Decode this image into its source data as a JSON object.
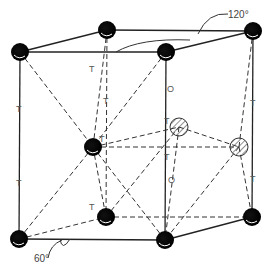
{
  "figure": {
    "type": "crystal-structure-hcp-unit-cell",
    "angles": {
      "top": "120°",
      "bottom": "60°"
    },
    "site_labels": {
      "tetrahedral": "T",
      "octahedral": "O"
    },
    "atoms": {
      "solid": [
        {
          "x": 107,
          "y": 30
        },
        {
          "x": 253,
          "y": 31
        },
        {
          "x": 20,
          "y": 52
        },
        {
          "x": 166,
          "y": 52
        },
        {
          "x": 93,
          "y": 147
        },
        {
          "x": 106,
          "y": 217
        },
        {
          "x": 252,
          "y": 217
        },
        {
          "x": 19,
          "y": 239
        },
        {
          "x": 165,
          "y": 240
        }
      ],
      "hatched": [
        {
          "x": 179,
          "y": 127
        },
        {
          "x": 239,
          "y": 147
        }
      ]
    },
    "colors": {
      "atom": "#000000",
      "line": "#222222",
      "dash": "#333333"
    }
  }
}
